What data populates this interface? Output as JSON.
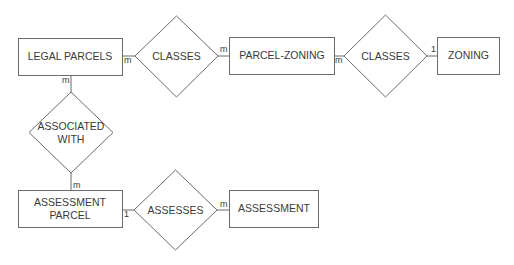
{
  "diagram": {
    "type": "entity-relationship",
    "entities": [
      {
        "id": "legal_parcels",
        "label": "LEGAL PARCELS"
      },
      {
        "id": "parcel_zoning",
        "label": "PARCEL-ZONING"
      },
      {
        "id": "zoning",
        "label": "ZONING"
      },
      {
        "id": "assessment_parcel",
        "label_line1": "ASSESSMENT",
        "label_line2": "PARCEL"
      },
      {
        "id": "assessment",
        "label": "ASSESSMENT"
      }
    ],
    "relationships": [
      {
        "id": "classes_1",
        "label": "CLASSES"
      },
      {
        "id": "classes_2",
        "label": "CLASSES"
      },
      {
        "id": "associated_with",
        "label_line1": "ASSOCIATED",
        "label_line2": "WITH"
      },
      {
        "id": "assesses",
        "label": "ASSESSES"
      }
    ],
    "cardinalities": {
      "legal_parcels_to_classes_1": "m",
      "classes_1_to_parcel_zoning": "m",
      "parcel_zoning_to_classes_2": "m",
      "classes_2_to_zoning": "1",
      "legal_parcels_to_associated_with": "m",
      "associated_with_to_assessment_parcel": "m",
      "assessment_parcel_to_assesses": "1",
      "assesses_to_assessment": "m"
    },
    "colors": {
      "stroke": "#6b6b6b",
      "text": "#3a3a3a",
      "background": "#ffffff"
    }
  }
}
